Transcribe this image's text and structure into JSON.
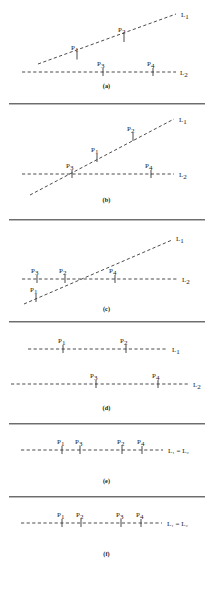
{
  "figure": {
    "title": "",
    "panel_count": 6,
    "line_labels": {
      "l1": "L",
      "l1_sub": "1",
      "l2": "L",
      "l2_sub": "2",
      "coincident": "L₁ = L₂"
    },
    "point_prefix": "P",
    "panels": [
      {
        "id": "a",
        "caption": "(a)",
        "description": "Two dashed lines crossing outside the labelled points; L1 rises to the right, L2 horizontal.",
        "lines": [
          {
            "name": "L1",
            "label": "L",
            "sub": "1",
            "label_x": 182,
            "label_y": 16
          },
          {
            "name": "L2",
            "label": "L",
            "sub": "2",
            "label_x": 181,
            "label_y": 73
          }
        ],
        "points": [
          {
            "name": "P1",
            "label": "P",
            "sub": "1",
            "on": "L1",
            "x": 77,
            "y": 56,
            "label_x": 71,
            "label_y": 50
          },
          {
            "name": "P2",
            "label": "P",
            "sub": "2",
            "on": "L1",
            "x": 124,
            "y": 38,
            "label_x": 118,
            "label_y": 31
          },
          {
            "name": "P3",
            "label": "P",
            "sub": "3",
            "on": "L2",
            "x": 103,
            "y": 72,
            "label_x": 97,
            "label_y": 65
          },
          {
            "name": "P4",
            "label": "P",
            "sub": "4",
            "on": "L2",
            "x": 153,
            "y": 72,
            "label_x": 147,
            "label_y": 65
          }
        ]
      },
      {
        "id": "b",
        "caption": "(b)",
        "description": "L1 crosses L2 at the left, at point P3; P1 and P2 lie on L1 above, P4 on L2 to the right.",
        "lines": [
          {
            "name": "L1",
            "label": "L",
            "sub": "1",
            "label_x": 180,
            "label_y": 16
          },
          {
            "name": "L2",
            "label": "L",
            "sub": "2",
            "label_x": 180,
            "label_y": 69
          }
        ],
        "points": [
          {
            "name": "P3",
            "label": "P",
            "sub": "3",
            "on": "both",
            "x": 72,
            "y": 69,
            "label_x": 66,
            "label_y": 62
          },
          {
            "name": "P1",
            "label": "P",
            "sub": "1",
            "on": "L1",
            "x": 97,
            "y": 53,
            "label_x": 91,
            "label_y": 46
          },
          {
            "name": "P2",
            "label": "P",
            "sub": "2",
            "on": "L1",
            "x": 133,
            "y": 32,
            "label_x": 127,
            "label_y": 25
          },
          {
            "name": "P4",
            "label": "P",
            "sub": "4",
            "on": "L2",
            "x": 151,
            "y": 69,
            "label_x": 145,
            "label_y": 62
          }
        ]
      },
      {
        "id": "c",
        "caption": "(c)",
        "description": "L1 crosses L2 at P2; P3 lies on L2 left of crossing, P1 on L1 below, P4 on L2 to the right.",
        "lines": [
          {
            "name": "L1",
            "label": "L",
            "sub": "1",
            "label_x": 178,
            "label_y": 15
          },
          {
            "name": "L2",
            "label": "L",
            "sub": "2",
            "label_x": 182,
            "label_y": 59
          }
        ],
        "points": [
          {
            "name": "P3",
            "label": "P",
            "sub": "3",
            "on": "L2",
            "x": 37,
            "y": 58,
            "label_x": 31,
            "label_y": 51
          },
          {
            "name": "P1",
            "label": "P",
            "sub": "1",
            "on": "L1",
            "x": 35,
            "y": 67,
            "label_x": 31,
            "label_y": 66
          },
          {
            "name": "P2",
            "label": "P",
            "sub": "2",
            "on": "both",
            "x": 65,
            "y": 58,
            "label_x": 59,
            "label_y": 51
          },
          {
            "name": "P4",
            "label": "P",
            "sub": "4",
            "on": "L2",
            "x": 115,
            "y": 58,
            "label_x": 109,
            "label_y": 51
          }
        ]
      },
      {
        "id": "d",
        "caption": "(d)",
        "description": "Two parallel horizontal dashed lines; P1 and P2 on L1, P3 and P4 on L2.",
        "lines": [
          {
            "name": "L1",
            "label": "L",
            "sub": "1",
            "label_x": 173,
            "label_y": 27
          },
          {
            "name": "L2",
            "label": "L",
            "sub": "2",
            "label_x": 194,
            "label_y": 62
          }
        ],
        "points": [
          {
            "name": "P1",
            "label": "P",
            "sub": "1",
            "on": "L1",
            "x": 63,
            "y": 26,
            "label_x": 58,
            "label_y": 19
          },
          {
            "name": "P2",
            "label": "P",
            "sub": "2",
            "on": "L1",
            "x": 126,
            "y": 26,
            "label_x": 120,
            "label_y": 19
          },
          {
            "name": "P3",
            "label": "P",
            "sub": "3",
            "on": "L2",
            "x": 96,
            "y": 61,
            "label_x": 90,
            "label_y": 54
          },
          {
            "name": "P4",
            "label": "P",
            "sub": "4",
            "on": "L2",
            "x": 158,
            "y": 61,
            "label_x": 152,
            "label_y": 54
          }
        ]
      },
      {
        "id": "e",
        "caption": "(e)",
        "description": "Single coincident line L1 = L2 carrying, in order, P1, P3, P2, P4.",
        "lines": [
          {
            "name": "L1=L2",
            "label": "L₁ = L₂",
            "label_x": 167,
            "label_y": 26
          }
        ],
        "points": [
          {
            "name": "P1",
            "label": "P",
            "sub": "1",
            "on": "L1=L2",
            "x": 62,
            "y": 25,
            "label_x": 57,
            "label_y": 18
          },
          {
            "name": "P3",
            "label": "P",
            "sub": "3",
            "on": "L1=L2",
            "x": 80,
            "y": 25,
            "label_x": 74,
            "label_y": 18
          },
          {
            "name": "P2",
            "label": "P",
            "sub": "2",
            "on": "L1=L2",
            "x": 122,
            "y": 25,
            "label_x": 116,
            "label_y": 18
          },
          {
            "name": "P4",
            "label": "P",
            "sub": "4",
            "on": "L1=L2",
            "x": 142,
            "y": 25,
            "label_x": 136,
            "label_y": 18
          }
        ]
      },
      {
        "id": "f",
        "caption": "(f)",
        "description": "Single coincident line L1 = L2 carrying, in order, P1, P2, P3, P4.",
        "lines": [
          {
            "name": "L1=L2",
            "label": "L₁ = L₂",
            "label_x": 166,
            "label_y": 26
          }
        ],
        "points": [
          {
            "name": "P1",
            "label": "P",
            "sub": "1",
            "on": "L1=L2",
            "x": 62,
            "y": 25,
            "label_x": 57,
            "label_y": 18
          },
          {
            "name": "P2",
            "label": "P",
            "sub": "2",
            "on": "L1=L2",
            "x": 81,
            "y": 25,
            "label_x": 75,
            "label_y": 18
          },
          {
            "name": "P3",
            "label": "P",
            "sub": "3",
            "on": "L1=L2",
            "x": 121,
            "y": 25,
            "label_x": 115,
            "label_y": 18
          },
          {
            "name": "P4",
            "label": "P",
            "sub": "4",
            "on": "L1=L2",
            "x": 141,
            "y": 25,
            "label_x": 135,
            "label_y": 18
          }
        ]
      }
    ],
    "captions": {
      "a": "(a)",
      "b": "(b)",
      "c": "(c)",
      "d": "(d)",
      "e": "(e)",
      "f": "(f)"
    },
    "colors": {
      "ink": "#2b2b2b",
      "rule": "#6d6d6d",
      "background": "#ffffff"
    }
  }
}
